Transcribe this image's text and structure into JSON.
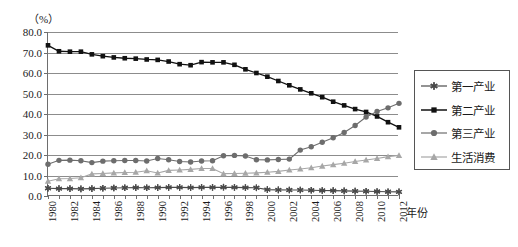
{
  "chart_data": {
    "type": "line",
    "title": "",
    "xlabel": "年份",
    "ylabel": "（%）",
    "ylim": [
      0.0,
      80.0
    ],
    "yticks": [
      "0.0",
      "10.0",
      "20.0",
      "30.0",
      "40.0",
      "50.0",
      "60.0",
      "70.0",
      "80.0"
    ],
    "ytick_values": [
      0,
      10,
      20,
      30,
      40,
      50,
      60,
      70,
      80
    ],
    "grid": true,
    "legend_position": "right",
    "xlim": [
      1980,
      2012
    ],
    "x": [
      1980,
      1981,
      1982,
      1983,
      1984,
      1985,
      1986,
      1987,
      1988,
      1989,
      1990,
      1991,
      1992,
      1993,
      1994,
      1995,
      1996,
      1997,
      1998,
      1999,
      2000,
      2001,
      2002,
      2003,
      2004,
      2005,
      2006,
      2007,
      2008,
      2009,
      2010,
      2011,
      2012
    ],
    "xtick_labels": [
      "1980",
      "1982",
      "1984",
      "1986",
      "1988",
      "1990",
      "1992",
      "1994",
      "1996",
      "1998",
      "2000",
      "2002",
      "2004",
      "2006",
      "2008",
      "2010",
      "2012"
    ],
    "xtick_values": [
      1980,
      1982,
      1984,
      1986,
      1988,
      1990,
      1992,
      1994,
      1996,
      1998,
      2000,
      2002,
      2004,
      2006,
      2008,
      2010,
      2012
    ],
    "series": [
      {
        "name": "第一产业",
        "marker": "star",
        "color": "#4a4a4a",
        "values": [
          3.8,
          3.6,
          3.6,
          3.5,
          3.6,
          3.8,
          3.9,
          4.0,
          4.1,
          4.0,
          4.1,
          4.2,
          4.2,
          4.1,
          4.2,
          4.2,
          4.3,
          4.2,
          4.1,
          4.0,
          3.1,
          3.0,
          2.9,
          2.9,
          2.8,
          2.7,
          2.6,
          2.5,
          2.4,
          2.3,
          2.2,
          2.1,
          2.0
        ]
      },
      {
        "name": "第二产业",
        "marker": "square",
        "color": "#111111",
        "values": [
          73.5,
          70.6,
          70.4,
          70.4,
          69.1,
          68.2,
          67.6,
          67.2,
          67.0,
          66.6,
          66.4,
          65.6,
          64.3,
          63.8,
          65.3,
          65.2,
          65.2,
          64.0,
          61.8,
          60.0,
          58.2,
          56.1,
          54.0,
          52.0,
          50.1,
          48.2,
          46.0,
          44.2,
          42.4,
          41.0,
          38.8,
          36.0,
          33.5
        ]
      },
      {
        "name": "第三产业",
        "marker": "circle",
        "color": "#6d6d6d",
        "values": [
          15.5,
          17.4,
          17.5,
          17.2,
          16.3,
          17.0,
          17.2,
          17.3,
          17.3,
          17.1,
          18.3,
          17.7,
          16.8,
          16.6,
          17.1,
          17.2,
          19.6,
          19.8,
          19.5,
          17.7,
          17.6,
          17.8,
          18.0,
          22.4,
          24.0,
          26.2,
          28.4,
          31.0,
          34.4,
          38.5,
          41.2,
          43.0,
          45.2
        ]
      },
      {
        "name": "生活消费",
        "marker": "triangle",
        "color": "#a7a7a7",
        "values": [
          7.2,
          8.4,
          8.5,
          8.9,
          10.8,
          11.0,
          11.3,
          11.5,
          11.6,
          12.3,
          11.2,
          12.5,
          12.7,
          13.0,
          13.4,
          13.4,
          10.9,
          11.0,
          11.1,
          11.3,
          11.6,
          12.0,
          12.7,
          13.2,
          13.8,
          14.6,
          15.3,
          16.0,
          16.8,
          17.6,
          18.3,
          19.2,
          19.8
        ]
      }
    ]
  },
  "legend": {
    "items": [
      {
        "label": "第一产业"
      },
      {
        "label": "第二产业"
      },
      {
        "label": "第三产业"
      },
      {
        "label": "生活消费"
      }
    ]
  }
}
